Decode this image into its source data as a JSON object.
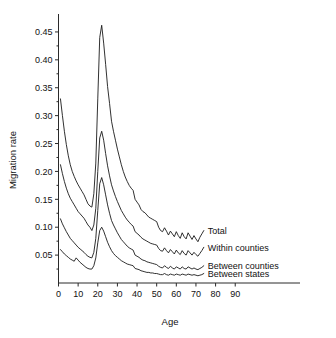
{
  "chart_data": {
    "type": "line",
    "title": "",
    "xlabel": "Age",
    "ylabel": "Migration rate",
    "xlim": [
      0,
      96
    ],
    "ylim": [
      0,
      0.475
    ],
    "grid": false,
    "legend_position": "inline-right",
    "xticks": [
      0,
      10,
      20,
      30,
      40,
      50,
      60,
      70,
      80,
      90
    ],
    "xticklabels": [
      "0",
      "10",
      "20",
      "30",
      "40",
      "50",
      "60",
      "70",
      "80",
      "90"
    ],
    "yticks": [
      0.05,
      0.1,
      0.15,
      0.2,
      0.25,
      0.3,
      0.35,
      0.4,
      0.45
    ],
    "yticklabels": [
      "0.05",
      "0.10",
      "0.15",
      "0.20",
      "0.25",
      "0.30",
      "0.35",
      "0.40",
      "0.45"
    ],
    "x": [
      1,
      2,
      3,
      4,
      5,
      6,
      7,
      8,
      9,
      10,
      11,
      12,
      13,
      14,
      15,
      16,
      17,
      18,
      19,
      20,
      21,
      22,
      23,
      24,
      25,
      26,
      27,
      28,
      29,
      30,
      31,
      32,
      33,
      34,
      35,
      36,
      37,
      38,
      39,
      40,
      41,
      42,
      43,
      44,
      45,
      46,
      47,
      48,
      49,
      50,
      51,
      52,
      53,
      54,
      55,
      56,
      57,
      58,
      59,
      60,
      61,
      62,
      63,
      64,
      65,
      66,
      67,
      68,
      69,
      70,
      71,
      72,
      73,
      74
    ],
    "series": [
      {
        "name": "Total",
        "label": "Total",
        "peak_value": 0.462,
        "peak_age": 21,
        "values": [
          0.33,
          0.3,
          0.272,
          0.248,
          0.228,
          0.212,
          0.2,
          0.191,
          0.183,
          0.176,
          0.17,
          0.164,
          0.158,
          0.15,
          0.142,
          0.138,
          0.136,
          0.16,
          0.215,
          0.33,
          0.44,
          0.462,
          0.43,
          0.392,
          0.352,
          0.322,
          0.29,
          0.272,
          0.256,
          0.24,
          0.226,
          0.212,
          0.2,
          0.19,
          0.182,
          0.175,
          0.17,
          0.166,
          0.15,
          0.145,
          0.14,
          0.132,
          0.128,
          0.126,
          0.122,
          0.118,
          0.116,
          0.114,
          0.112,
          0.11,
          0.1,
          0.094,
          0.092,
          0.099,
          0.093,
          0.086,
          0.093,
          0.088,
          0.083,
          0.092,
          0.085,
          0.08,
          0.09,
          0.083,
          0.079,
          0.09,
          0.084,
          0.078,
          0.085,
          0.079,
          0.074,
          0.082,
          0.088,
          0.094
        ]
      },
      {
        "name": "Within counties",
        "label": "Within counties",
        "peak_value": 0.272,
        "peak_age": 21,
        "values": [
          0.212,
          0.196,
          0.182,
          0.17,
          0.16,
          0.152,
          0.146,
          0.14,
          0.134,
          0.128,
          0.124,
          0.12,
          0.116,
          0.11,
          0.104,
          0.1,
          0.094,
          0.104,
          0.134,
          0.2,
          0.26,
          0.272,
          0.256,
          0.232,
          0.21,
          0.192,
          0.176,
          0.165,
          0.155,
          0.146,
          0.138,
          0.13,
          0.124,
          0.118,
          0.113,
          0.109,
          0.105,
          0.102,
          0.092,
          0.089,
          0.086,
          0.082,
          0.079,
          0.077,
          0.075,
          0.073,
          0.071,
          0.07,
          0.069,
          0.068,
          0.062,
          0.058,
          0.057,
          0.063,
          0.058,
          0.054,
          0.06,
          0.056,
          0.052,
          0.059,
          0.054,
          0.051,
          0.058,
          0.053,
          0.05,
          0.058,
          0.054,
          0.05,
          0.055,
          0.051,
          0.048,
          0.053,
          0.058,
          0.064
        ]
      },
      {
        "name": "Between counties",
        "label": "Between counties",
        "peak_value": 0.189,
        "peak_age": 21,
        "values": [
          0.115,
          0.106,
          0.099,
          0.092,
          0.086,
          0.08,
          0.076,
          0.072,
          0.068,
          0.064,
          0.061,
          0.058,
          0.055,
          0.051,
          0.048,
          0.046,
          0.045,
          0.055,
          0.08,
          0.13,
          0.178,
          0.189,
          0.176,
          0.158,
          0.14,
          0.125,
          0.112,
          0.104,
          0.097,
          0.09,
          0.084,
          0.078,
          0.074,
          0.07,
          0.066,
          0.063,
          0.061,
          0.059,
          0.05,
          0.048,
          0.046,
          0.043,
          0.041,
          0.04,
          0.038,
          0.037,
          0.036,
          0.035,
          0.034,
          0.033,
          0.03,
          0.028,
          0.027,
          0.031,
          0.028,
          0.026,
          0.03,
          0.027,
          0.025,
          0.029,
          0.027,
          0.025,
          0.029,
          0.026,
          0.025,
          0.029,
          0.027,
          0.025,
          0.027,
          0.025,
          0.024,
          0.026,
          0.028,
          0.031
        ]
      },
      {
        "name": "Between states",
        "label": "Between states",
        "peak_value": 0.1,
        "peak_age": 21,
        "values": [
          0.06,
          0.056,
          0.052,
          0.049,
          0.046,
          0.043,
          0.041,
          0.039,
          0.045,
          0.041,
          0.037,
          0.034,
          0.031,
          0.028,
          0.026,
          0.025,
          0.025,
          0.031,
          0.045,
          0.072,
          0.094,
          0.1,
          0.093,
          0.083,
          0.073,
          0.065,
          0.058,
          0.053,
          0.049,
          0.046,
          0.043,
          0.04,
          0.038,
          0.036,
          0.034,
          0.033,
          0.032,
          0.031,
          0.026,
          0.025,
          0.024,
          0.022,
          0.021,
          0.02,
          0.019,
          0.019,
          0.018,
          0.018,
          0.017,
          0.017,
          0.016,
          0.015,
          0.015,
          0.017,
          0.015,
          0.014,
          0.016,
          0.015,
          0.014,
          0.016,
          0.015,
          0.014,
          0.016,
          0.015,
          0.014,
          0.016,
          0.015,
          0.014,
          0.015,
          0.014,
          0.013,
          0.014,
          0.015,
          0.017
        ]
      }
    ]
  }
}
